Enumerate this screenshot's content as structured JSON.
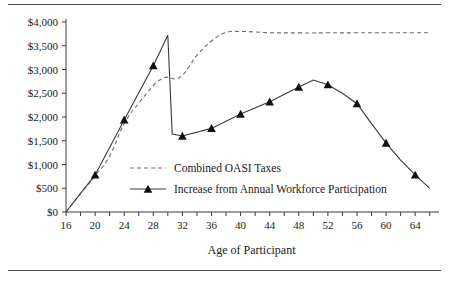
{
  "figure": {
    "name": "oasi-taxes-vs-workforce-participation-chart",
    "top_rule": true,
    "bottom_rule": true
  },
  "chart_data": {
    "type": "line",
    "title": "",
    "subtitle": "",
    "xlabel": "Age of Participant",
    "ylabel": "",
    "xlim": [
      16,
      67
    ],
    "ylim": [
      0,
      4000
    ],
    "grid": false,
    "legend_position": "inside-center-lower",
    "x_ticks": [
      16,
      20,
      24,
      28,
      32,
      36,
      40,
      44,
      48,
      52,
      56,
      60,
      64
    ],
    "x_tick_labels": [
      "16",
      "20",
      "24",
      "28",
      "32",
      "36",
      "40",
      "44",
      "48",
      "52",
      "56",
      "60",
      "64"
    ],
    "x_minor_ticks": [
      16,
      18,
      20,
      22,
      24,
      26,
      28,
      30,
      32,
      34,
      36,
      38,
      40,
      42,
      44,
      46,
      48,
      50,
      52,
      54,
      56,
      58,
      60,
      62,
      64,
      66
    ],
    "y_ticks": [
      0,
      500,
      1000,
      1500,
      2000,
      2500,
      3000,
      3500,
      4000
    ],
    "y_tick_labels": [
      "$0",
      "$500",
      "$1,000",
      "$1,500",
      "$2,000",
      "$2,500",
      "$3,000",
      "$3,500",
      "$4,000"
    ],
    "series": [
      {
        "name": "Combined OASI Taxes",
        "style": "dashed",
        "color": "#6a6a6a",
        "markers": false,
        "x": [
          16,
          18,
          20,
          22,
          24,
          26,
          28,
          29,
          30,
          31,
          32,
          33,
          34,
          36,
          38,
          40,
          42,
          44,
          48,
          52,
          56,
          60,
          64,
          66
        ],
        "values": [
          0,
          390,
          760,
          1180,
          1860,
          2290,
          2660,
          2790,
          2840,
          2800,
          2880,
          3080,
          3300,
          3600,
          3780,
          3800,
          3790,
          3775,
          3770,
          3772,
          3772,
          3775,
          3775,
          3775
        ]
      },
      {
        "name": "Increase from Annual Workforce Participation",
        "style": "solid",
        "color": "#3a3a3a",
        "markers": true,
        "marker_shape": "triangle",
        "marker_x": [
          20,
          24,
          28,
          32,
          36,
          40,
          44,
          48,
          52,
          56,
          60,
          64
        ],
        "x": [
          16,
          20,
          24,
          28,
          30,
          30.6,
          32,
          36,
          40,
          44,
          48,
          50,
          52,
          54,
          56,
          58,
          60,
          62,
          64,
          66
        ],
        "values": [
          0,
          780,
          1940,
          3080,
          3720,
          1640,
          1600,
          1760,
          2060,
          2320,
          2630,
          2780,
          2680,
          2500,
          2280,
          1860,
          1450,
          1090,
          780,
          500
        ]
      }
    ],
    "legend": [
      {
        "label": "Combined OASI Taxes",
        "style": "dashed",
        "marker": false
      },
      {
        "label": "Increase from Annual Workforce Participation",
        "style": "solid",
        "marker": true
      }
    ]
  }
}
